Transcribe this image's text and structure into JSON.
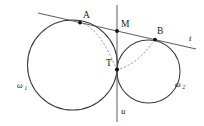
{
  "figure": {
    "background_color": "#ffffff",
    "width": 204,
    "height": 126,
    "stroke_color": "#3a3a3a",
    "dashed_color": "#8a8a8a",
    "point_color": "#111111"
  },
  "circles": [
    {
      "id": "omega1",
      "label": "ω",
      "subscript": "1",
      "label_x": 17,
      "label_y": 88,
      "cx": 72.5,
      "cy": 65.0,
      "r": 45.0,
      "style": "solid"
    },
    {
      "id": "omega2",
      "label": "ω",
      "subscript": "2",
      "label_x": 175,
      "label_y": 87,
      "cx": 148.5,
      "cy": 71.5,
      "r": 31.5,
      "style": "solid"
    }
  ],
  "points": [
    {
      "id": "A",
      "label": "A",
      "x": 80.0,
      "y": 22.6,
      "label_x": 83,
      "label_y": 18,
      "description": "tangency point of line t with circle omega1"
    },
    {
      "id": "M",
      "label": "M",
      "x": 117.0,
      "y": 31.0,
      "label_x": 121,
      "label_y": 27,
      "description": "intersection of line t with line u, midpoint of AB"
    },
    {
      "id": "B",
      "label": "B",
      "x": 155.0,
      "y": 39.6,
      "label_x": 157,
      "label_y": 34,
      "description": "tangency point of line t with circle omega2"
    },
    {
      "id": "T",
      "label": "T",
      "x": 117.0,
      "y": 69.5,
      "label_x": 106,
      "label_y": 66,
      "description": "external tangency point of the two circles"
    }
  ],
  "lines": [
    {
      "id": "t",
      "label": "t",
      "label_x": 189,
      "label_y": 41,
      "x1": 38.0,
      "y1": 13.0,
      "x2": 196.0,
      "y2": 49.0,
      "style": "solid",
      "description": "common external tangent line"
    },
    {
      "id": "u",
      "label": "u",
      "label_x": 121,
      "label_y": 114,
      "x1": 117.0,
      "y1": 5.0,
      "x2": 117.0,
      "y2": 122.0,
      "style": "solid",
      "description": "common internal tangent through T, vertical"
    }
  ],
  "dashed_arcs": [
    {
      "id": "arc-A-T",
      "from": "A",
      "to": "T",
      "path": "M 80.0 22.6 C 98.0 28.0 107.0 48.0 117.0 69.5",
      "description": "dashed arc from A curving to T inside omega1"
    },
    {
      "id": "arc-B-T",
      "from": "B",
      "to": "T",
      "path": "M 155.0 39.6 C 148.0 49.0 135.0 66.0 117.0 69.5",
      "description": "dashed arc from B curving to T inside omega2"
    }
  ]
}
